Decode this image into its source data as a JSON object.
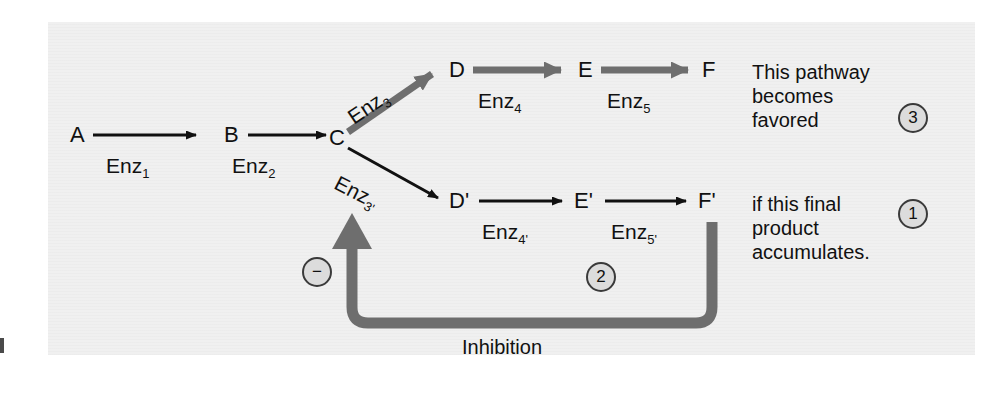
{
  "figure": {
    "type": "branched-metabolic-pathway-with-feedback-inhibition",
    "background_color": "#f0f0f0",
    "thick_arrow_color": "#6e6e6e",
    "thin_arrow_color": "#111111",
    "marker_fill_color": "#dcdcdc",
    "marker_stroke_color": "#3a3a3a"
  },
  "nodes": {
    "a": "A",
    "b": "B",
    "c": "C",
    "d": "D",
    "e": "E",
    "f": "F",
    "d_prime": "D'",
    "e_prime": "E'",
    "f_prime": "F'"
  },
  "enzymes": {
    "enz1": {
      "base": "Enz",
      "sub": "1"
    },
    "enz2": {
      "base": "Enz",
      "sub": "2"
    },
    "enz3": {
      "base": "Enz",
      "sub": "3"
    },
    "enz4": {
      "base": "Enz",
      "sub": "4"
    },
    "enz5": {
      "base": "Enz",
      "sub": "5"
    },
    "enz3p": {
      "base": "Enz",
      "sub": "3'"
    },
    "enz4p": {
      "base": "Enz",
      "sub": "4'"
    },
    "enz5p": {
      "base": "Enz",
      "sub": "5'"
    }
  },
  "annotations": {
    "top_note": "This pathway becomes favored",
    "bottom_note": "if this final product accumulates.",
    "inhibition_label": "Inhibition",
    "minus_sign": "−",
    "step_3": "3",
    "step_2": "2",
    "step_1": "1"
  }
}
